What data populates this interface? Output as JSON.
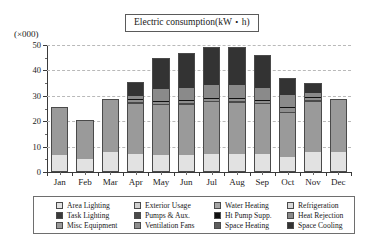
{
  "chart_data": {
    "type": "bar",
    "stacked": true,
    "title": "Electric consumption(kW・h)",
    "units_label": "(×000)",
    "xlabel": "",
    "ylabel": "",
    "ylim": [
      0,
      50
    ],
    "yticks": [
      0,
      10,
      20,
      30,
      40,
      50
    ],
    "ytick_labels": [
      "0",
      "10",
      "20",
      "30",
      "40",
      "50"
    ],
    "grid": true,
    "grid_style": "dashed-horizontal",
    "legend_position": "bottom",
    "categories": [
      "Jan",
      "Feb",
      "Mar",
      "Apr",
      "May",
      "Jun",
      "Jul",
      "Aug",
      "Sep",
      "Oct",
      "Nov",
      "Dec"
    ],
    "series": [
      {
        "name": "Area Lighting",
        "color": "#e2e2e2",
        "values": [
          6.6,
          5.3,
          7.8,
          7.2,
          6.7,
          6.8,
          7.1,
          7.0,
          7.0,
          6.1,
          7.7,
          8.0
        ]
      },
      {
        "name": "Task Lighting",
        "color": "#3a3a3a",
        "values": [
          0.0,
          0.0,
          0.0,
          0.0,
          0.0,
          0.0,
          0.0,
          0.0,
          0.0,
          0.0,
          0.0,
          0.0
        ]
      },
      {
        "name": "Misc Equipment",
        "color": "#9a9a9a",
        "values": [
          18.8,
          15.2,
          21.0,
          19.5,
          19.6,
          19.6,
          20.3,
          20.3,
          19.7,
          17.0,
          19.9,
          20.8
        ]
      },
      {
        "name": "Exterior Usage",
        "color": "#d0d0d0",
        "values": [
          0.0,
          0.0,
          0.0,
          0.0,
          0.0,
          0.0,
          0.0,
          0.0,
          0.0,
          0.0,
          0.0,
          0.0
        ]
      },
      {
        "name": "Pumps & Aux.",
        "color": "#4a4a4a",
        "values": [
          0.0,
          0.0,
          0.0,
          0.7,
          0.6,
          0.6,
          0.6,
          0.6,
          0.6,
          0.6,
          0.7,
          0.0
        ]
      },
      {
        "name": "Ventilation Fans",
        "color": "#8e8e8e",
        "values": [
          0.0,
          0.0,
          0.0,
          0.9,
          0.9,
          0.9,
          0.9,
          0.9,
          0.9,
          1.6,
          0.9,
          0.0
        ]
      },
      {
        "name": "Water Heating",
        "color": "#a6a6a6",
        "values": [
          0.0,
          0.0,
          0.0,
          0.0,
          0.0,
          0.0,
          0.0,
          0.0,
          0.0,
          0.0,
          0.0,
          0.0
        ]
      },
      {
        "name": "Ht Pump Supp.",
        "color": "#111111",
        "values": [
          0.0,
          0.0,
          0.0,
          0.3,
          0.3,
          0.3,
          0.3,
          0.3,
          0.3,
          0.3,
          0.3,
          0.0
        ]
      },
      {
        "name": "Space Heating",
        "color": "#5e5e5e",
        "values": [
          0.0,
          0.0,
          0.0,
          0.0,
          0.0,
          0.0,
          0.0,
          0.0,
          0.0,
          0.0,
          0.0,
          0.0
        ]
      },
      {
        "name": "Refrigeration",
        "color": "#d8d8d8",
        "values": [
          0.0,
          0.0,
          0.0,
          0.0,
          0.0,
          0.0,
          0.0,
          0.0,
          0.0,
          0.0,
          0.0,
          0.0
        ]
      },
      {
        "name": "Heat Rejection",
        "color": "#8a8a8a",
        "values": [
          0.0,
          0.0,
          0.0,
          1.5,
          4.6,
          4.8,
          5.2,
          5.2,
          4.7,
          4.8,
          1.6,
          0.0
        ]
      },
      {
        "name": "Space Cooling",
        "color": "#333333",
        "values": [
          0.0,
          0.0,
          0.0,
          5.2,
          12.1,
          14.0,
          15.0,
          15.1,
          13.0,
          6.8,
          4.1,
          0.0
        ]
      }
    ],
    "totals": [
      25.4,
      20.5,
      28.8,
      35.3,
      44.8,
      47.0,
      49.4,
      49.4,
      46.2,
      37.2,
      35.2,
      28.8
    ]
  },
  "legend": {
    "columns": [
      {
        "items": [
          {
            "label": "Area Lighting",
            "color": "#e2e2e2"
          },
          {
            "label": "Task Lighting",
            "color": "#3a3a3a"
          },
          {
            "label": "Misc Equipment",
            "color": "#9a9a9a"
          }
        ]
      },
      {
        "items": [
          {
            "label": "Exterior Usage",
            "color": "#d0d0d0"
          },
          {
            "label": "Pumps & Aux.",
            "color": "#4a4a4a"
          },
          {
            "label": "Ventilation Fans",
            "color": "#8e8e8e"
          }
        ]
      },
      {
        "items": [
          {
            "label": "Water Heating",
            "color": "#a6a6a6"
          },
          {
            "label": "Ht Pump Supp.",
            "color": "#111111"
          },
          {
            "label": "Space Heating",
            "color": "#5e5e5e"
          }
        ]
      },
      {
        "items": [
          {
            "label": "Refrigeration",
            "color": "#d8d8d8"
          },
          {
            "label": "Heat Rejection",
            "color": "#8a8a8a"
          },
          {
            "label": "Space Cooling",
            "color": "#333333"
          }
        ]
      }
    ]
  }
}
